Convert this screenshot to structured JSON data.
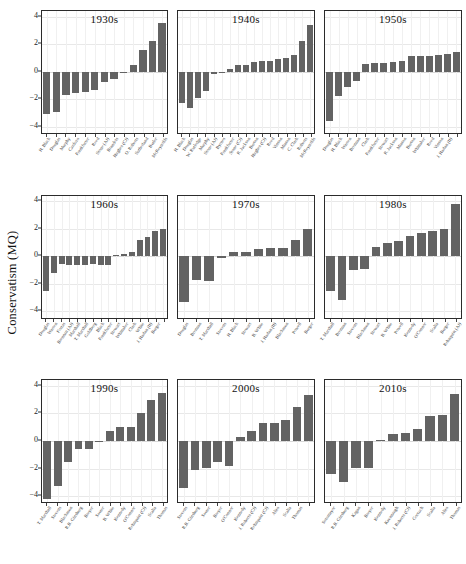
{
  "chart_data": {
    "type": "bar",
    "title": "",
    "ylabel": "Conservatism (MQ)",
    "xlabel": "",
    "ylim": [
      -4.6,
      4.4
    ],
    "yticks": [
      4,
      2,
      0,
      -2,
      -4
    ],
    "grid": true,
    "legend": "none",
    "bar_color": "#636363",
    "layout": "3x3 small multiples by decade",
    "panels": [
      {
        "title": "1930s",
        "categories": [
          "H. Black",
          "Douglas",
          "Murphy",
          "Cardozo",
          "Frankfurter",
          "Reed",
          "Stone (AJ)",
          "Brandeis",
          "Hughes (CJ)",
          "O. Roberts",
          "Sutherland",
          "Butler",
          "McReynolds"
        ],
        "values": [
          -3.1,
          -2.9,
          -1.7,
          -1.55,
          -1.45,
          -1.3,
          -0.75,
          -0.55,
          -0.05,
          0.5,
          1.55,
          2.25,
          3.5
        ]
      },
      {
        "title": "1940s",
        "categories": [
          "H. Black",
          "Douglas",
          "W. Rutledge",
          "Murphy",
          "Stone (AJ)",
          "Byrnes",
          "Frankfurter",
          "Stone (CJ)",
          "R. Jackson",
          "Burton",
          "Hughes (CJ)",
          "Reed",
          "Vinson",
          "Minton",
          "C. Clark",
          "Roberts",
          "McReynolds"
        ],
        "values": [
          -2.3,
          -2.65,
          -1.95,
          -1.4,
          -0.15,
          -0.08,
          0.22,
          0.45,
          0.48,
          0.68,
          0.75,
          0.8,
          0.95,
          0.98,
          1.2,
          2.2,
          3.35
        ]
      },
      {
        "title": "1950s",
        "categories": [
          "Douglas",
          "H. Black",
          "Warren",
          "Brennan",
          "Clark",
          "Frankfurter",
          "Stewart",
          "R. Jackson",
          "Minton",
          "Burton",
          "Whittaker",
          "Reed",
          "Vinson",
          "J. Harlan (II)"
        ],
        "values": [
          -3.55,
          -1.75,
          -1.15,
          -0.7,
          0.55,
          0.62,
          0.65,
          0.68,
          0.8,
          1.1,
          1.1,
          1.12,
          1.2,
          1.25,
          1.42
        ]
      },
      {
        "title": "1960s",
        "categories": [
          "Douglas",
          "Warren",
          "Fortas",
          "Brennan (AJ)",
          "Marshall",
          "T. Marshall",
          "Goldberg",
          "Black",
          "Frankfurter",
          "Stewart",
          "Whittaker",
          "Clark",
          "White",
          "J. Harlan (II)",
          "Burger"
        ],
        "values": [
          -2.55,
          -1.25,
          -0.55,
          -0.62,
          -0.62,
          -0.62,
          -0.55,
          -0.62,
          -0.62,
          0.1,
          0.2,
          0.3,
          1.2,
          1.4,
          1.85,
          2.0
        ]
      },
      {
        "title": "1970s",
        "categories": [
          "Douglas",
          "Brennan",
          "T. Marshall",
          "Stevens",
          "H. Black",
          "Stewart",
          "B. White",
          "J. Harlan (II)",
          "Blackmun",
          "Powell",
          "Burger",
          "Rehnquist (AJ)"
        ],
        "values": [
          -3.3,
          -1.75,
          -1.8,
          -0.1,
          0.3,
          0.3,
          0.55,
          0.6,
          0.6,
          1.2,
          2.0
        ]
      },
      {
        "title": "1980s",
        "categories": [
          "T. Marshall",
          "Brennan",
          "Stevens",
          "Blackmun",
          "Stewart",
          "B. White",
          "Powell",
          "Kennedy",
          "O'Connor",
          "Scalia",
          "Burger",
          "Rehnquist (AJ)"
        ],
        "values": [
          -2.55,
          -3.2,
          -1.0,
          -0.9,
          0.7,
          0.95,
          1.1,
          1.5,
          1.7,
          1.85,
          2.0,
          3.8
        ]
      },
      {
        "title": "1990s",
        "categories": [
          "T. Marshall",
          "Stevens",
          "Blackmun",
          "R.B. Ginsburg",
          "Breyer",
          "Souter",
          "B. White",
          "Kennedy",
          "O'Connor",
          "Rehnquist (CJ)",
          "Scalia",
          "Thomas"
        ],
        "values": [
          -4.2,
          -3.3,
          -1.5,
          -0.55,
          -0.55,
          -0.08,
          0.7,
          1.0,
          1.0,
          2.0,
          3.0,
          3.5
        ]
      },
      {
        "title": "2000s",
        "categories": [
          "Stevens",
          "R.B. Ginsburg",
          "Souter",
          "Breyer",
          "O'Connor",
          "Kennedy",
          "J. Roberts (CJ)",
          "Rehnquist (CJ)",
          "Alito",
          "Scalia",
          "Thomas"
        ],
        "values": [
          -3.4,
          -2.1,
          -2.0,
          -1.55,
          -1.8,
          0.3,
          0.7,
          1.3,
          1.3,
          1.5,
          2.5,
          3.3
        ]
      },
      {
        "title": "2010s",
        "categories": [
          "Sotomayor",
          "R.B. Ginsburg",
          "Kagan",
          "Breyer",
          "Kennedy",
          "Kavanaugh",
          "J. Roberts (CJ)",
          "Gorsuch",
          "Scalia",
          "Alito",
          "Thomas"
        ],
        "values": [
          -2.4,
          -3.0,
          -2.0,
          -2.0,
          0.1,
          0.5,
          0.6,
          0.9,
          1.8,
          1.9,
          3.4
        ]
      }
    ]
  }
}
